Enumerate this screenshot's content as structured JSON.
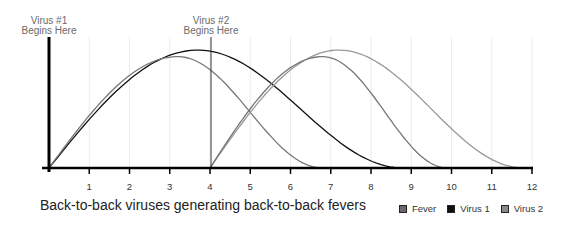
{
  "chart_data": {
    "type": "line",
    "title": "Back-to-back viruses generating back-to-back fevers",
    "xlabel": "",
    "ylabel": "",
    "xlim": [
      0,
      12
    ],
    "x_ticks": [
      1,
      2,
      3,
      4,
      5,
      6,
      7,
      8,
      9,
      10,
      11,
      12
    ],
    "grid": "vertical",
    "legend_position": "bottom-right",
    "annotations": [
      {
        "x": 0,
        "text": "Virus #1\nBegins Here"
      },
      {
        "x": 4,
        "text": "Virus #2\nBegins Here"
      }
    ],
    "series": [
      {
        "name": "Virus 1",
        "color": "#111111",
        "start": 0,
        "peak_x": 3.7,
        "peak_y": 0.9,
        "end": 8.8
      },
      {
        "name": "Fever",
        "color": "#777777",
        "start": 0,
        "peak_x": 3.2,
        "peak_y": 0.85,
        "end": 6.8
      },
      {
        "name": "Virus 2",
        "color": "#999999",
        "start": 4,
        "peak_x": 7.2,
        "peak_y": 0.9,
        "end": 11.8
      },
      {
        "name": "Fever",
        "color": "#777777",
        "start": 4,
        "peak_x": 6.8,
        "peak_y": 0.85,
        "end": 9.9
      }
    ]
  },
  "annotations": {
    "virus1_line1": "Virus #1",
    "virus1_line2": "Begins Here",
    "virus2_line1": "Virus #2",
    "virus2_line2": "Begins Here"
  },
  "ticks": [
    "1",
    "2",
    "3",
    "4",
    "5",
    "6",
    "7",
    "8",
    "9",
    "10",
    "11",
    "12"
  ],
  "caption": "Back-to-back viruses generating back-to-back fevers",
  "legend": [
    {
      "label": "Fever",
      "color": "#6a6a6a"
    },
    {
      "label": "Virus 1",
      "color": "#111111"
    },
    {
      "label": "Virus 2",
      "color": "#8a8a8a"
    }
  ]
}
